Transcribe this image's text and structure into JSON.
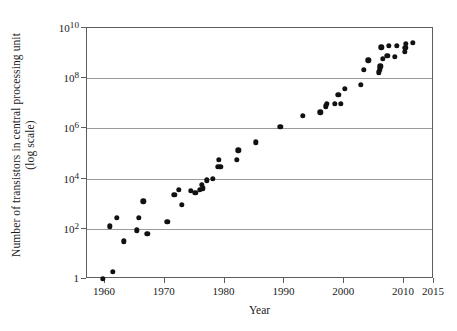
{
  "chart_data": {
    "type": "scatter",
    "title": "",
    "xlabel": "Year",
    "ylabel_line1": "Number of transistors in central processing unit",
    "ylabel_line2": "(log scale)",
    "y_scale": "log",
    "xlim": [
      1957,
      2015
    ],
    "ylim": [
      1,
      10000000000
    ],
    "grid": true,
    "legend": "none",
    "marker_color": "#111111",
    "axis_color": "#5d5d5d",
    "grid_color": "#9a9a9a",
    "xticks": [
      {
        "value": 1960,
        "label": "1960"
      },
      {
        "value": 1970,
        "label": "1970"
      },
      {
        "value": 1980,
        "label": "1980"
      },
      {
        "value": 1990,
        "label": "1990"
      },
      {
        "value": 2000,
        "label": "2000"
      },
      {
        "value": 2010,
        "label": "2010"
      },
      {
        "value": 2015,
        "label": "2015"
      }
    ],
    "yticks": [
      {
        "value": 10000000000,
        "mantissa": "10",
        "exponent": "10"
      },
      {
        "value": 100000000,
        "mantissa": "10",
        "exponent": "8"
      },
      {
        "value": 1000000,
        "mantissa": "10",
        "exponent": "6"
      },
      {
        "value": 10000,
        "mantissa": "10",
        "exponent": "4"
      },
      {
        "value": 100,
        "mantissa": "10",
        "exponent": "2"
      },
      {
        "value": 1,
        "mantissa": "1",
        "exponent": ""
      }
    ],
    "points": [
      {
        "x": 1959.6,
        "y": 1.0
      },
      {
        "x": 1961.3,
        "y": 1.9
      },
      {
        "x": 1960.8,
        "y": 125
      },
      {
        "x": 1962.0,
        "y": 270
      },
      {
        "x": 1963.2,
        "y": 32
      },
      {
        "x": 1965.3,
        "y": 88
      },
      {
        "x": 1965.7,
        "y": 270
      },
      {
        "x": 1966.4,
        "y": 1250
      },
      {
        "x": 1967.1,
        "y": 62
      },
      {
        "x": 1970.4,
        "y": 185
      },
      {
        "x": 1971.6,
        "y": 2300
      },
      {
        "x": 1972.3,
        "y": 3500
      },
      {
        "x": 1972.8,
        "y": 900
      },
      {
        "x": 1974.3,
        "y": 3200
      },
      {
        "x": 1975.1,
        "y": 2700
      },
      {
        "x": 1975.9,
        "y": 3500
      },
      {
        "x": 1976.2,
        "y": 5800
      },
      {
        "x": 1976.4,
        "y": 4100
      },
      {
        "x": 1977.0,
        "y": 8500
      },
      {
        "x": 1978.0,
        "y": 9800
      },
      {
        "x": 1978.9,
        "y": 29000
      },
      {
        "x": 1979.3,
        "y": 30000
      },
      {
        "x": 1979.0,
        "y": 55000
      },
      {
        "x": 1982.0,
        "y": 55000
      },
      {
        "x": 1982.3,
        "y": 134000
      },
      {
        "x": 1985.2,
        "y": 275000
      },
      {
        "x": 1989.3,
        "y": 1180000
      },
      {
        "x": 1993.1,
        "y": 3100000
      },
      {
        "x": 1996.0,
        "y": 4300000
      },
      {
        "x": 1996.9,
        "y": 7500000
      },
      {
        "x": 1997.1,
        "y": 9500000
      },
      {
        "x": 1998.4,
        "y": 9500000
      },
      {
        "x": 1999.0,
        "y": 22000000
      },
      {
        "x": 1999.4,
        "y": 9300000
      },
      {
        "x": 2000.1,
        "y": 37000000
      },
      {
        "x": 2002.8,
        "y": 55000000
      },
      {
        "x": 2003.3,
        "y": 220000000
      },
      {
        "x": 2004.0,
        "y": 520000000
      },
      {
        "x": 2005.8,
        "y": 170000000
      },
      {
        "x": 2005.9,
        "y": 230000000
      },
      {
        "x": 2006.0,
        "y": 300000000
      },
      {
        "x": 2006.2,
        "y": 1700000000
      },
      {
        "x": 2006.4,
        "y": 580000000
      },
      {
        "x": 2007.2,
        "y": 790000000
      },
      {
        "x": 2007.4,
        "y": 2000000000
      },
      {
        "x": 2008.4,
        "y": 730000000
      },
      {
        "x": 2008.8,
        "y": 1900000000
      },
      {
        "x": 2010.1,
        "y": 1150000000
      },
      {
        "x": 2010.2,
        "y": 1600000000
      },
      {
        "x": 2010.3,
        "y": 2300000000
      },
      {
        "x": 2011.5,
        "y": 2600000000
      }
    ]
  }
}
